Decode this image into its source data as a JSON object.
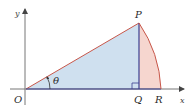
{
  "diagram": {
    "points": {
      "O": {
        "label": "O",
        "x": 26,
        "y": 89
      },
      "P": {
        "label": "P",
        "x": 139,
        "y": 23
      },
      "Q": {
        "label": "Q",
        "x": 139,
        "y": 89
      },
      "R": {
        "label": "R",
        "x": 161,
        "y": 89
      }
    },
    "axes": {
      "x_label": "x",
      "y_label": "y"
    },
    "angle_label": "θ",
    "colors": {
      "triangle_fill": "#cfe0ef",
      "sector_fill": "#f6d6cf",
      "arc_stroke": "#c8574a",
      "hypotenuse_stroke": "#c8574a",
      "vertical_stroke": "#3b3f8f",
      "axis_stroke": "#777777"
    }
  }
}
